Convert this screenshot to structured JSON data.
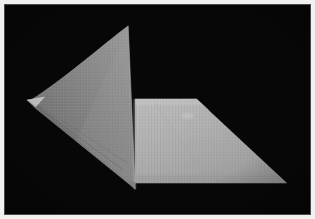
{
  "image": {
    "title": "Folded gray sheet on black background",
    "subject": "folded-fabric-sheet",
    "background_label": "black backdrop",
    "border_label": "white photo border",
    "width": 315,
    "height": 219,
    "colors": {
      "background": "#070707",
      "border": "#f2f1ef",
      "frame_line": "#4a4a4a",
      "shaded_panel_light": "#8e8e8e",
      "shaded_panel_dark": "#6d6d6d",
      "lit_panel_light": "#b4b4b4",
      "lit_panel_dark": "#9c9c9c",
      "fold_highlight": "#c2c2c2",
      "crease_shadow": "#5f5f5f",
      "tip_highlight": "#c8c8c8"
    },
    "regions": [
      {
        "name": "shaded-left-panel",
        "description": "Darker gray curved triangular panel tilted toward the viewer on the left",
        "points": "128,25 135,190 30,106 26,100",
        "curve_note": "concave upper-left edge sweeping from apex to left tip"
      },
      {
        "name": "lit-right-panel",
        "description": "Lighter gray quadrilateral panel lying flat to the right",
        "points": "135,99 197,99 288,184 135,184"
      },
      {
        "name": "fold-line",
        "description": "Vertical crease where the two panels meet",
        "from": "135,99",
        "to": "135,190"
      },
      {
        "name": "left-tip",
        "description": "Sharp pointed corner of the sheet at far left",
        "at": "26,100"
      },
      {
        "name": "top-apex",
        "description": "Upper peak of the raised panel",
        "at": "128,25"
      },
      {
        "name": "bottom-vertex",
        "description": "Lowest point of the raised panel",
        "at": "135,190"
      },
      {
        "name": "right-corner",
        "description": "Far right corner of the flat panel",
        "at": "288,184"
      }
    ]
  }
}
